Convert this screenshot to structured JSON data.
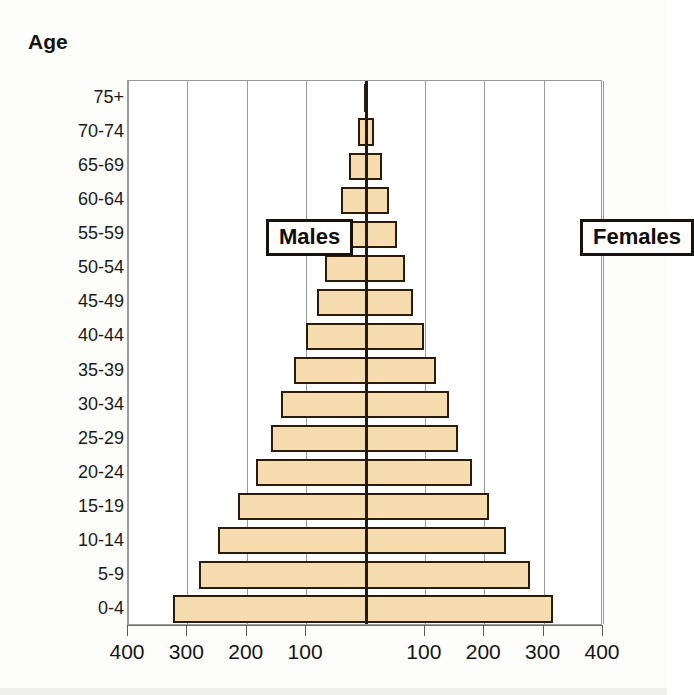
{
  "chart_data": {
    "type": "bar",
    "title": "",
    "subtitle": "",
    "axis_caption": "Age",
    "xlabel": "",
    "ylabel": "Age",
    "orientation": "horizontal-diverging",
    "grid": true,
    "legend_position": "inside-top-left-and-top-right",
    "xlim": [
      -400,
      400
    ],
    "x_tick_values": [
      -400,
      -300,
      -200,
      -100,
      100,
      200,
      300,
      400
    ],
    "x_tick_labels": [
      "400",
      "300",
      "200",
      "100",
      "100",
      "200",
      "300",
      "400"
    ],
    "categories": [
      "0-4",
      "5-9",
      "10-14",
      "15-19",
      "20-24",
      "25-29",
      "30-34",
      "35-39",
      "40-44",
      "45-49",
      "50-54",
      "55-59",
      "60-64",
      "65-69",
      "70-74",
      "75+"
    ],
    "series": [
      {
        "name": "Males",
        "side": "left",
        "values": [
          325,
          280,
          248,
          215,
          185,
          160,
          143,
          120,
          100,
          82,
          68,
          55,
          42,
          28,
          12,
          2
        ]
      },
      {
        "name": "Females",
        "side": "right",
        "values": [
          315,
          277,
          237,
          208,
          180,
          155,
          140,
          118,
          98,
          80,
          66,
          53,
          40,
          27,
          15,
          2
        ]
      }
    ],
    "bar_fill_color": "#f7dcb0",
    "bar_border_color": "#2a1d10",
    "gridline_color": "#9a9a9a"
  },
  "chart": {
    "caption": "Age",
    "legend": {
      "males_label": "Males",
      "females_label": "Females"
    },
    "y_tick_labels": [
      "75+",
      "70-74",
      "65-69",
      "60-64",
      "55-59",
      "50-54",
      "45-49",
      "40-44",
      "35-39",
      "30-34",
      "25-29",
      "20-24",
      "15-19",
      "10-14",
      "5-9",
      "0-4"
    ],
    "x_tick_labels": [
      "400",
      "300",
      "200",
      "100",
      "100",
      "200",
      "300",
      "400"
    ]
  }
}
